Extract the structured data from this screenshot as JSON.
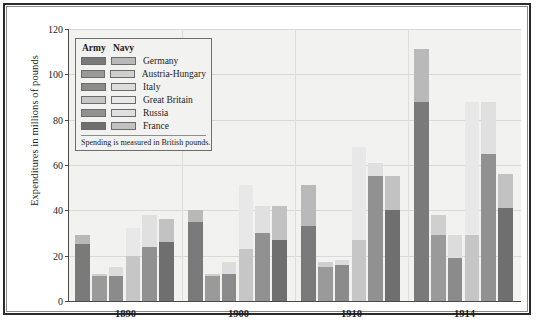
{
  "legend": {
    "army_header": "Army",
    "navy_header": "Navy",
    "note": "Spending is measured in British pounds.",
    "entries": [
      {
        "name": "Germany",
        "army_color": "#7a7a7a",
        "navy_color": "#b9b9b9"
      },
      {
        "name": "Austria-Hungary",
        "army_color": "#9a9a9a",
        "navy_color": "#cfcfcf"
      },
      {
        "name": "Italy",
        "army_color": "#8b8b8b",
        "navy_color": "#dcdcdc"
      },
      {
        "name": "Great Britain",
        "army_color": "#c6c6c6",
        "navy_color": "#e8e8e8"
      },
      {
        "name": "Russia",
        "army_color": "#919191",
        "navy_color": "#e0e0e0"
      },
      {
        "name": "France",
        "army_color": "#6f6f6f",
        "navy_color": "#c2c2c2"
      }
    ]
  },
  "chart_data": {
    "type": "bar",
    "subtype": "grouped-stacked",
    "title": "",
    "xlabel": "",
    "ylabel": "Expenditures in millions of pounds",
    "ylim": [
      0,
      120
    ],
    "yticks": [
      0,
      20,
      40,
      60,
      80,
      100,
      120
    ],
    "grid": true,
    "legend_position": "upper-left-inside",
    "categories": [
      "1890",
      "1900",
      "1910",
      "1914"
    ],
    "stack_order": [
      "Army",
      "Navy"
    ],
    "countries": [
      "Germany",
      "Austria-Hungary",
      "Italy",
      "Great Britain",
      "Russia",
      "France"
    ],
    "series": [
      {
        "name": "Germany",
        "army": [
          25,
          35,
          33,
          88
        ],
        "navy": [
          4,
          5,
          18,
          23
        ],
        "totals": [
          29,
          40,
          51,
          111
        ]
      },
      {
        "name": "Austria-Hungary",
        "army": [
          11,
          11,
          15,
          29
        ],
        "navy": [
          1,
          1,
          2,
          9
        ],
        "totals": [
          12,
          12,
          17,
          38
        ]
      },
      {
        "name": "Italy",
        "army": [
          11,
          12,
          16,
          19
        ],
        "navy": [
          4,
          5,
          2,
          10
        ],
        "totals": [
          15,
          17,
          18,
          29
        ]
      },
      {
        "name": "Great Britain",
        "army": [
          20,
          23,
          27,
          29
        ],
        "navy": [
          12,
          28,
          41,
          59
        ],
        "totals": [
          32,
          51,
          68,
          88
        ]
      },
      {
        "name": "Russia",
        "army": [
          24,
          30,
          55,
          65
        ],
        "navy": [
          14,
          12,
          6,
          23
        ],
        "totals": [
          38,
          42,
          61,
          88
        ]
      },
      {
        "name": "France",
        "army": [
          26,
          27,
          40,
          41
        ],
        "navy": [
          10,
          15,
          15,
          15
        ],
        "totals": [
          36,
          42,
          55,
          56
        ]
      }
    ]
  }
}
